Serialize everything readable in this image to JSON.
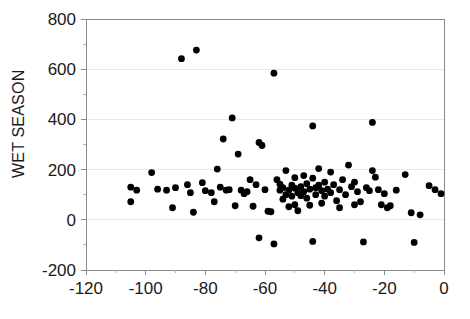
{
  "chart_data": {
    "type": "scatter",
    "title": "",
    "subtitle": "",
    "xlabel": "",
    "ylabel": "WET SEASON",
    "xlim": [
      -120,
      0
    ],
    "ylim": [
      -200,
      800
    ],
    "x_major_ticks": [
      -120,
      -100,
      -80,
      -60,
      -40,
      -20,
      0
    ],
    "x_tick_labels": [
      "-120",
      "-100",
      "-80",
      "-60",
      "-40",
      "-20",
      "0"
    ],
    "x_minor_step": 10,
    "y_major_ticks": [
      -200,
      0,
      200,
      400,
      600,
      800
    ],
    "y_tick_labels": [
      "-200",
      "0",
      "200",
      "400",
      "600",
      "800"
    ],
    "y_minor_step": 100,
    "grid": "horizontal-major-light",
    "legend": "none",
    "marker": "filled-circle",
    "marker_color": "#000000",
    "marker_size": 4,
    "series": [
      {
        "name": "observations",
        "points": [
          [
            -105,
            130
          ],
          [
            -105,
            72
          ],
          [
            -103,
            118
          ],
          [
            -98,
            188
          ],
          [
            -96,
            122
          ],
          [
            -93,
            118
          ],
          [
            -91,
            48
          ],
          [
            -90,
            128
          ],
          [
            -88,
            642
          ],
          [
            -86,
            140
          ],
          [
            -85,
            108
          ],
          [
            -84,
            30
          ],
          [
            -83,
            676
          ],
          [
            -81,
            148
          ],
          [
            -80,
            116
          ],
          [
            -78,
            108
          ],
          [
            -77,
            72
          ],
          [
            -76,
            202
          ],
          [
            -75,
            130
          ],
          [
            -74,
            322
          ],
          [
            -73,
            118
          ],
          [
            -72,
            120
          ],
          [
            -71,
            406
          ],
          [
            -70,
            56
          ],
          [
            -69,
            262
          ],
          [
            -68,
            118
          ],
          [
            -67,
            104
          ],
          [
            -66,
            112
          ],
          [
            -65,
            160
          ],
          [
            -64,
            54
          ],
          [
            -63,
            140
          ],
          [
            -62,
            308
          ],
          [
            -61,
            296
          ],
          [
            -60,
            120
          ],
          [
            -59,
            34
          ],
          [
            -58,
            32
          ],
          [
            -57,
            584
          ],
          [
            -57,
            -96
          ],
          [
            -56,
            160
          ],
          [
            -55,
            142
          ],
          [
            -55,
            118
          ],
          [
            -54,
            128
          ],
          [
            -54,
            82
          ],
          [
            -53,
            196
          ],
          [
            -53,
            100
          ],
          [
            -52,
            118
          ],
          [
            -52,
            52
          ],
          [
            -51,
            138
          ],
          [
            -51,
            94
          ],
          [
            -50,
            168
          ],
          [
            -50,
            126
          ],
          [
            -50,
            60
          ],
          [
            -49,
            108
          ],
          [
            -49,
            36
          ],
          [
            -48,
            132
          ],
          [
            -48,
            96
          ],
          [
            -47,
            176
          ],
          [
            -47,
            112
          ],
          [
            -46,
            144
          ],
          [
            -46,
            86
          ],
          [
            -45,
            122
          ],
          [
            -45,
            58
          ],
          [
            -44,
            374
          ],
          [
            -44,
            166
          ],
          [
            -43,
            128
          ],
          [
            -43,
            100
          ],
          [
            -42,
            204
          ],
          [
            -42,
            138
          ],
          [
            -41,
            116
          ],
          [
            -41,
            66
          ],
          [
            -40,
            150
          ],
          [
            -40,
            94
          ],
          [
            -39,
            122
          ],
          [
            -38,
            190
          ],
          [
            -38,
            108
          ],
          [
            -37,
            140
          ],
          [
            -36,
            76
          ],
          [
            -35,
            120
          ],
          [
            -35,
            48
          ],
          [
            -34,
            160
          ],
          [
            -33,
            100
          ],
          [
            -32,
            218
          ],
          [
            -31,
            132
          ],
          [
            -30,
            150
          ],
          [
            -30,
            60
          ],
          [
            -29,
            112
          ],
          [
            -28,
            72
          ],
          [
            -27,
            -88
          ],
          [
            -26,
            128
          ],
          [
            -25,
            116
          ],
          [
            -24,
            388
          ],
          [
            -24,
            196
          ],
          [
            -23,
            170
          ],
          [
            -22,
            120
          ],
          [
            -21,
            60
          ],
          [
            -20,
            104
          ],
          [
            -19,
            48
          ],
          [
            -18,
            56
          ],
          [
            -16,
            118
          ],
          [
            -13,
            180
          ],
          [
            -11,
            28
          ],
          [
            -10,
            -90
          ],
          [
            -8,
            20
          ],
          [
            -5,
            136
          ],
          [
            -3,
            120
          ],
          [
            -1,
            104
          ],
          [
            -62,
            -72
          ],
          [
            -44,
            -86
          ]
        ]
      }
    ]
  },
  "axes": {
    "plot_left_px": 86,
    "plot_right_px": 444,
    "plot_top_px": 19,
    "plot_bottom_px": 270
  }
}
